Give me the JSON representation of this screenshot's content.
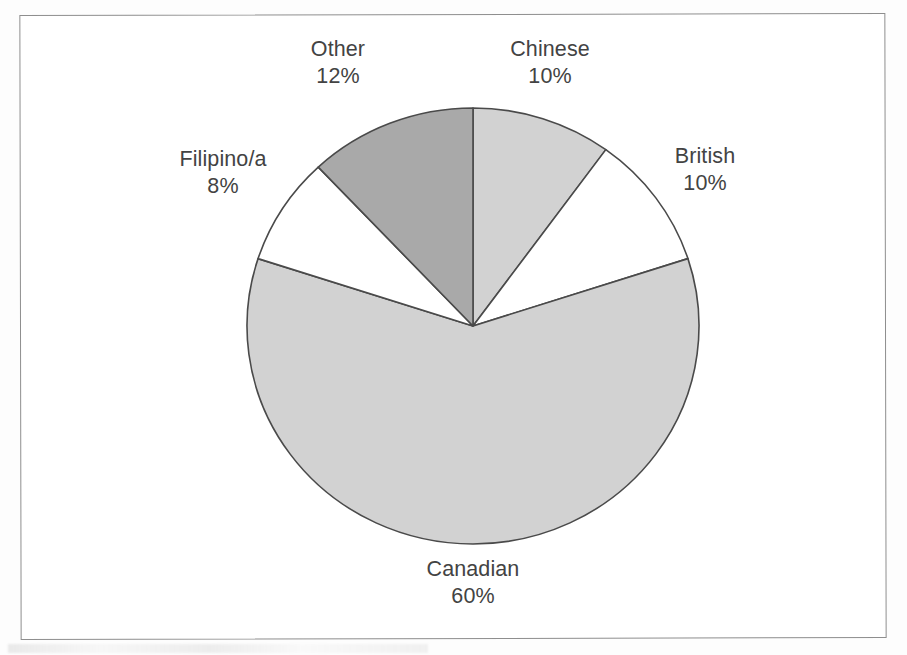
{
  "figure": {
    "kind": "pie-chart-figure",
    "background_color": "#ffffff",
    "frame_color": "#8e8e8e"
  },
  "chart_data": {
    "type": "pie",
    "title": "",
    "subtitle": "",
    "xlabel": "",
    "ylabel": "",
    "grid": false,
    "legend_position": "none",
    "label_format": "name above percent",
    "start_angle_deg": 0,
    "direction": "clockwise",
    "units": "percent",
    "total": 100,
    "categories": [
      "Chinese",
      "British",
      "Canadian",
      "Filipino/a",
      "Other"
    ],
    "values": [
      10,
      10,
      60,
      8,
      12
    ],
    "slices": [
      {
        "name": "Chinese",
        "value": 10,
        "value_text": "10%",
        "fill": "#d2d2d2",
        "stroke": "#4a4a4a",
        "start_deg": 0,
        "end_deg": 36,
        "label_position": "top-right"
      },
      {
        "name": "British",
        "value": 10,
        "value_text": "10%",
        "fill": "#ffffff",
        "stroke": "#4a4a4a",
        "start_deg": 36,
        "end_deg": 72,
        "label_position": "right"
      },
      {
        "name": "Canadian",
        "value": 60,
        "value_text": "60%",
        "fill": "#d2d2d2",
        "stroke": "#4a4a4a",
        "start_deg": 72,
        "end_deg": 288,
        "label_position": "bottom"
      },
      {
        "name": "Filipino/a",
        "value": 8,
        "value_text": "8%",
        "fill": "#ffffff",
        "stroke": "#4a4a4a",
        "start_deg": 288,
        "end_deg": 316.8,
        "label_position": "left"
      },
      {
        "name": "Other",
        "value": 12,
        "value_text": "12%",
        "fill": "#a9a9a9",
        "stroke": "#4a4a4a",
        "start_deg": 316.8,
        "end_deg": 360,
        "label_position": "top-left"
      }
    ]
  },
  "geometry": {
    "center_x": 473,
    "center_y": 326,
    "radius_x": 226,
    "radius_y": 218
  },
  "labels": {
    "other": {
      "name": "Other",
      "value": "12%"
    },
    "chinese": {
      "name": "Chinese",
      "value": "10%"
    },
    "british": {
      "name": "British",
      "value": "10%"
    },
    "filipino": {
      "name": "Filipino/a",
      "value": "8%"
    },
    "canadian": {
      "name": "Canadian",
      "value": "60%"
    }
  }
}
